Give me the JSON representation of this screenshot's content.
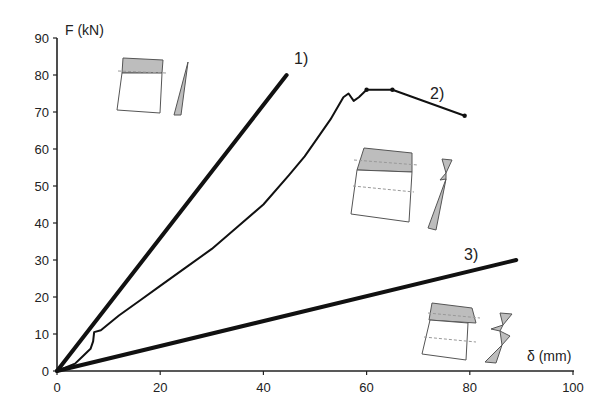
{
  "chart_data": {
    "type": "line",
    "title": "",
    "xlabel": "δ (mm)",
    "ylabel": "F (kN)",
    "xlim": [
      0,
      100
    ],
    "ylim": [
      0,
      90
    ],
    "x_ticks": [
      0,
      20,
      40,
      60,
      80,
      100
    ],
    "y_ticks": [
      0,
      10,
      20,
      30,
      40,
      50,
      60,
      70,
      80,
      90
    ],
    "grid": false,
    "legend": "none (inline labels 1), 2), 3))",
    "series": [
      {
        "name": "1)",
        "style": "thick straight line",
        "points": [
          [
            0,
            0
          ],
          [
            44.5,
            80
          ]
        ]
      },
      {
        "name": "2)",
        "style": "thin experimental curve",
        "points": [
          [
            0,
            0
          ],
          [
            3.5,
            2
          ],
          [
            5,
            4
          ],
          [
            6.5,
            6
          ],
          [
            7,
            8
          ],
          [
            7.2,
            10.5
          ],
          [
            8.5,
            11
          ],
          [
            12,
            15
          ],
          [
            16,
            19
          ],
          [
            20,
            23
          ],
          [
            25,
            28
          ],
          [
            30,
            33
          ],
          [
            35,
            39
          ],
          [
            40,
            45
          ],
          [
            45,
            53
          ],
          [
            48,
            58
          ],
          [
            50,
            62
          ],
          [
            53,
            68
          ],
          [
            55.5,
            74
          ],
          [
            56.5,
            75
          ],
          [
            57.5,
            73
          ],
          [
            58.5,
            74
          ],
          [
            60,
            76
          ],
          [
            65,
            76
          ],
          [
            79,
            69
          ]
        ]
      },
      {
        "name": "3)",
        "style": "thick straight line",
        "points": [
          [
            0,
            0
          ],
          [
            89,
            30
          ]
        ]
      }
    ],
    "annotations": [
      {
        "label": "1)",
        "x": 47,
        "y": 83
      },
      {
        "label": "2)",
        "x": 72,
        "y": 72
      },
      {
        "label": "3)",
        "x": 81,
        "y": 33
      },
      {
        "label": "section-sketch-1",
        "description": "beam section with shaded top zone and triangular stress diagram",
        "near_series": "1)"
      },
      {
        "label": "section-sketch-2",
        "description": "section with shaded top zone, dashed lines and double-triangle stress diagram",
        "near_series": "2)"
      },
      {
        "label": "section-sketch-3",
        "description": "trapezoidal section with shaded top zone, dashed line and zig-zag stress diagram",
        "near_series": "3)"
      }
    ]
  },
  "axes": {
    "y_title": "F (kN)",
    "x_title": "δ (mm)",
    "y_ticks": [
      "0",
      "10",
      "20",
      "30",
      "40",
      "50",
      "60",
      "70",
      "80",
      "90"
    ],
    "x_ticks": [
      "0",
      "20",
      "40",
      "60",
      "80",
      "100"
    ]
  },
  "labels": {
    "series1": "1)",
    "series2": "2)",
    "series3": "3)"
  }
}
